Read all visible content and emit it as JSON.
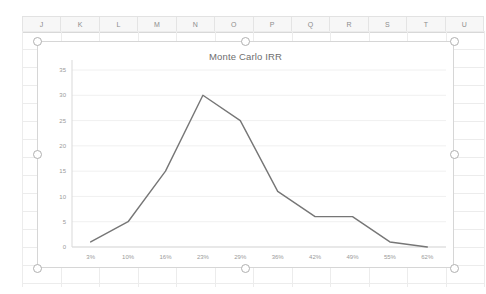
{
  "spreadsheet": {
    "columns": [
      "J",
      "K",
      "L",
      "M",
      "N",
      "O",
      "P",
      "Q",
      "R",
      "S",
      "T",
      "U"
    ]
  },
  "chart": {
    "title": "Monte Carlo IRR",
    "line_color": "#767676",
    "gridline_color": "#f0f0f0",
    "axis_color": "#d9d9d9"
  },
  "chart_data": {
    "type": "line",
    "title": "Monte Carlo IRR",
    "xlabel": "",
    "ylabel": "",
    "categories": [
      "3%",
      "10%",
      "16%",
      "23%",
      "29%",
      "36%",
      "42%",
      "49%",
      "55%",
      "62%"
    ],
    "values": [
      1,
      5,
      15,
      30,
      25,
      11,
      6,
      6,
      1,
      0
    ],
    "ylim": [
      0,
      35
    ],
    "yticks": [
      0,
      5,
      10,
      15,
      20,
      25,
      30,
      35
    ],
    "grid": true,
    "legend": false,
    "markers": false
  },
  "selection": {
    "handle_count": 8
  }
}
